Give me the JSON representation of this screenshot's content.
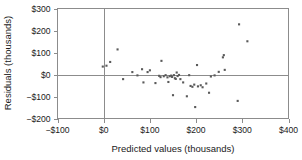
{
  "chart_data": {
    "type": "scatter",
    "title": "",
    "xlabel": "Predicted values (thousands)",
    "ylabel": "Residuals (thousands)",
    "xlim": [
      -100,
      400
    ],
    "ylim": [
      -200,
      300
    ],
    "xticks": [
      -100,
      0,
      100,
      200,
      300,
      400
    ],
    "yticks": [
      -200,
      -100,
      0,
      100,
      200,
      300
    ],
    "xtick_labels": [
      "−$100",
      "$0",
      "$100",
      "$200",
      "$300",
      "$400"
    ],
    "ytick_labels": [
      "−$200",
      "−$100",
      "$0",
      "$100",
      "$200",
      "$300"
    ],
    "grid": false,
    "legend": null,
    "reference_lines": [
      {
        "axis": "horizontal",
        "value": 0
      },
      {
        "axis": "vertical",
        "value": 0
      }
    ],
    "marker": {
      "shape": "square",
      "size": 2.1,
      "color": "#5a5a5a"
    },
    "points": [
      {
        "x": -2,
        "y": 36
      },
      {
        "x": 6,
        "y": 40
      },
      {
        "x": 14,
        "y": 57
      },
      {
        "x": 30,
        "y": 114
      },
      {
        "x": 42,
        "y": -21
      },
      {
        "x": 62,
        "y": 11
      },
      {
        "x": 73,
        "y": -4
      },
      {
        "x": 83,
        "y": 24
      },
      {
        "x": 86,
        "y": -36
      },
      {
        "x": 95,
        "y": 11
      },
      {
        "x": 100,
        "y": 19
      },
      {
        "x": 112,
        "y": -39
      },
      {
        "x": 120,
        "y": -6
      },
      {
        "x": 123,
        "y": -12
      },
      {
        "x": 125,
        "y": 62
      },
      {
        "x": 130,
        "y": -8
      },
      {
        "x": 134,
        "y": -3
      },
      {
        "x": 138,
        "y": -13
      },
      {
        "x": 140,
        "y": -34
      },
      {
        "x": 143,
        "y": -8
      },
      {
        "x": 146,
        "y": -5
      },
      {
        "x": 148,
        "y": -11
      },
      {
        "x": 150,
        "y": -94
      },
      {
        "x": 152,
        "y": -3
      },
      {
        "x": 154,
        "y": -17
      },
      {
        "x": 156,
        "y": -20
      },
      {
        "x": 158,
        "y": 9
      },
      {
        "x": 160,
        "y": -7
      },
      {
        "x": 163,
        "y": -2
      },
      {
        "x": 166,
        "y": -21
      },
      {
        "x": 172,
        "y": -36
      },
      {
        "x": 180,
        "y": -99
      },
      {
        "x": 185,
        "y": -3
      },
      {
        "x": 188,
        "y": -52
      },
      {
        "x": 192,
        "y": -56
      },
      {
        "x": 196,
        "y": -46
      },
      {
        "x": 198,
        "y": -148
      },
      {
        "x": 202,
        "y": 43
      },
      {
        "x": 204,
        "y": -54
      },
      {
        "x": 210,
        "y": -49
      },
      {
        "x": 214,
        "y": -58
      },
      {
        "x": 222,
        "y": -41
      },
      {
        "x": 228,
        "y": -83
      },
      {
        "x": 232,
        "y": -9
      },
      {
        "x": 240,
        "y": -4
      },
      {
        "x": 249,
        "y": 12
      },
      {
        "x": 258,
        "y": 78
      },
      {
        "x": 260,
        "y": 88
      },
      {
        "x": 262,
        "y": 21
      },
      {
        "x": 290,
        "y": -120
      },
      {
        "x": 293,
        "y": 228
      },
      {
        "x": 311,
        "y": 151
      }
    ]
  }
}
